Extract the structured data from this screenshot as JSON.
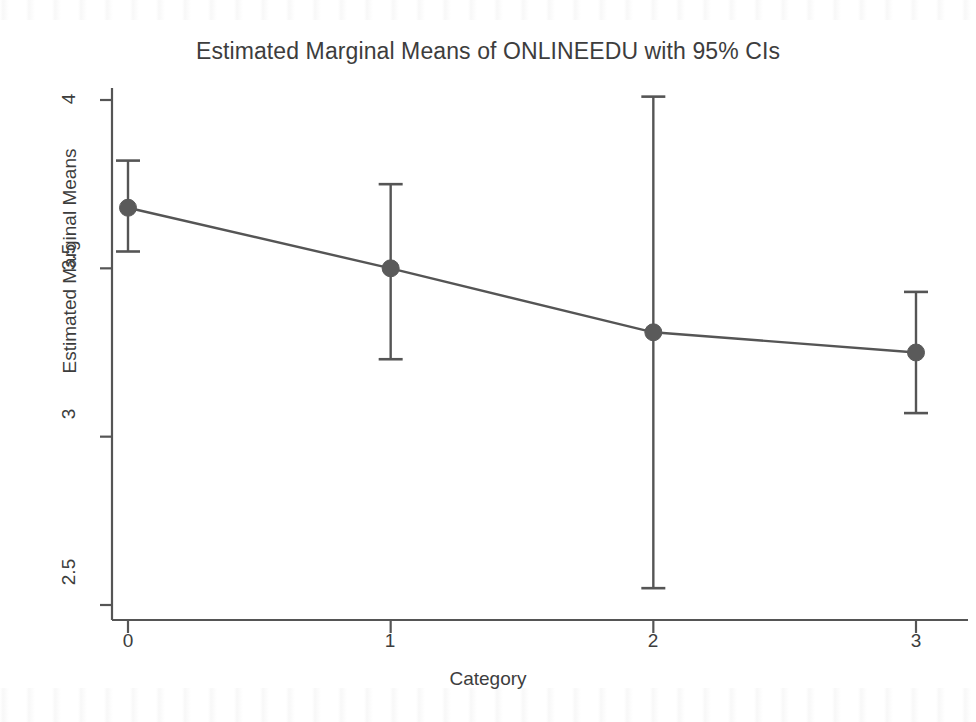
{
  "chart_data": {
    "type": "line",
    "title": "Estimated Marginal Means of ONLINEEDU with 95% CIs",
    "xlabel": "Category",
    "ylabel": "Estimated Marginal Means",
    "categories": [
      "0",
      "1",
      "2",
      "3"
    ],
    "x": [
      0,
      1,
      2,
      3
    ],
    "values": [
      3.68,
      3.5,
      3.31,
      3.25
    ],
    "ci_upper": [
      3.82,
      3.75,
      4.01,
      3.43
    ],
    "ci_lower": [
      3.55,
      3.23,
      2.55,
      3.07
    ],
    "series": [
      {
        "name": "Estimated Marginal Means",
        "values": [
          3.68,
          3.5,
          3.31,
          3.25
        ],
        "ci_upper": [
          3.82,
          3.75,
          4.01,
          3.43
        ],
        "ci_lower": [
          3.55,
          3.23,
          2.55,
          3.07
        ]
      }
    ],
    "xlim": [
      -0.17,
      3.17
    ],
    "ylim": [
      2.42,
      4.08
    ],
    "ytick_values": [
      2.5,
      3,
      3.5,
      4
    ],
    "ytick_labels": [
      "2.5",
      "3",
      "3.5",
      "4"
    ],
    "xtick_values": [
      0,
      1,
      2,
      3
    ],
    "xtick_labels": [
      "0",
      "1",
      "2",
      "3"
    ],
    "grid": false,
    "legend": "none",
    "error_bars": "95% confidence intervals",
    "marker": "filled-circle",
    "colors": {
      "line": "#555555",
      "marker": "#5a5a5a",
      "error_bar": "#555555",
      "axis": "#555555",
      "text": "#3d3d3d",
      "background": "#ffffff"
    }
  },
  "axes": {
    "y_ticks": [
      {
        "label": "4",
        "top": 100
      },
      {
        "label": "3.5",
        "top": 258
      },
      {
        "label": "3",
        "top": 415
      },
      {
        "label": "2.5",
        "top": 573
      }
    ],
    "x_ticks": [
      {
        "label": "0",
        "left": 128
      },
      {
        "label": "1",
        "left": 390
      },
      {
        "label": "2",
        "left": 653
      },
      {
        "label": "3",
        "left": 916
      }
    ]
  }
}
